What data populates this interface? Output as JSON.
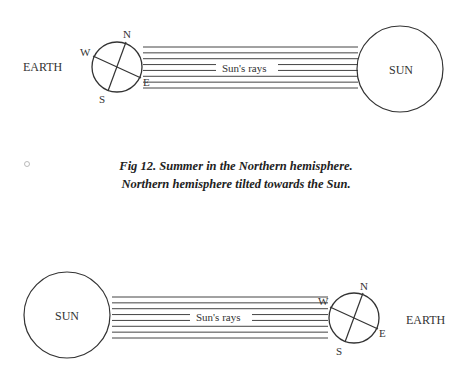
{
  "figure_top": {
    "earth_label": "EARTH",
    "sun_label": "SUN",
    "rays_label": "Sun's rays",
    "compass": {
      "north": "N",
      "south": "S",
      "east": "E",
      "west": "W"
    },
    "ray_count": 8
  },
  "caption": {
    "marker": "○",
    "line1": "Fig 12.  Summer in the Northern hemisphere.",
    "line2": "Northern hemisphere tilted towards the Sun."
  },
  "figure_bottom": {
    "earth_label": "EARTH",
    "sun_label": "SUN",
    "rays_label": "Sun's rays",
    "compass": {
      "north": "N",
      "south": "S",
      "east": "E",
      "west": "W"
    },
    "ray_count": 8
  },
  "colors": {
    "ink": "#333333",
    "background": "#ffffff"
  }
}
